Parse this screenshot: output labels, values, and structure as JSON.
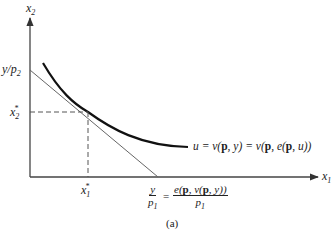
{
  "diagram": {
    "type": "economics-indifference-budget",
    "axes": {
      "x_label": "x",
      "x_label_sub": "1",
      "y_label": "x",
      "y_label_sub": "2"
    },
    "y_intercept_label": {
      "num": "y/p",
      "sub": "2"
    },
    "x2_star": {
      "base": "x",
      "sub": "2",
      "sup": "*"
    },
    "x1_star": {
      "base": "x",
      "sub": "1",
      "sup": "*"
    },
    "curve_label": {
      "u": "u = v(",
      "p1": "p",
      "mid1": ", y) = v(",
      "p2": "p",
      "mid2": ", e(",
      "p3": "p",
      "end": ", u))"
    },
    "x_intercept_label": {
      "left_num": "y",
      "left_den": "p",
      "left_den_sub": "1",
      "equals": "=",
      "right_num_a": "e(",
      "right_num_p1": "p",
      "right_num_b": ", v(",
      "right_num_p2": "p",
      "right_num_c": ", y))",
      "right_den": "p",
      "right_den_sub": "1"
    },
    "caption": "(a)",
    "colors": {
      "axis": "#444444",
      "curve": "#111111",
      "budget_line": "#666666",
      "dashed": "#555555"
    }
  }
}
